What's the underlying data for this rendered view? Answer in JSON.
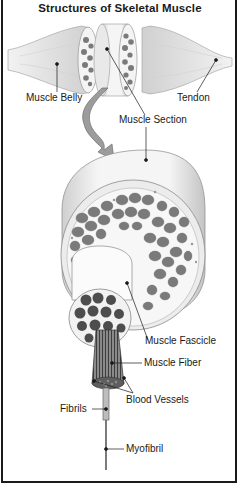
{
  "title": "Structures of Skeletal Muscle",
  "labels": {
    "muscle_belly": "Muscle Belly",
    "tendon": "Tendon",
    "muscle_section": "Muscle Section",
    "muscle_fascicle": "Muscle Fascicle",
    "muscle_fiber": "Muscle Fiber",
    "blood_vessels": "Blood Vessels",
    "fibrils": "Fibrils",
    "myofibril": "Myofibril"
  },
  "colors": {
    "line": "#1a1a1a",
    "muscle_light": "#e6e6e6",
    "muscle_mid": "#c8c8c8",
    "bundle": "#7d7d7d",
    "bundle_dark": "#4a4a4a"
  }
}
